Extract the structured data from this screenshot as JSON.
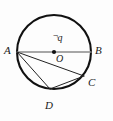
{
  "figure": {
    "type": "circle-geometry-diagram",
    "background_color": "#fdfdfd",
    "circle_stroke_color": "#111111",
    "diameter_stroke_color": "#8a8a8a",
    "chord_stroke_color": "#222222",
    "label_color": "#1a1a1a",
    "circle": {
      "center_x": 54,
      "center_y": 52,
      "radius": 37,
      "stroke_width": 2.1
    },
    "center_dot": {
      "name": "center-point-O",
      "x": 54,
      "y": 52,
      "radius": 2.1,
      "fill": "#111111"
    },
    "points": [
      {
        "id": "A",
        "label": "A",
        "x": 17,
        "y": 52,
        "label_x": 4,
        "label_y": 45
      },
      {
        "id": "B",
        "label": "B",
        "x": 91,
        "y": 52,
        "label_x": 95,
        "label_y": 45
      },
      {
        "id": "C",
        "label": "C",
        "x": 84,
        "y": 76,
        "label_x": 88,
        "label_y": 77
      },
      {
        "id": "D",
        "label": "D",
        "x": 50,
        "y": 89,
        "label_x": 45,
        "label_y": 100
      },
      {
        "id": "O",
        "label": "O",
        "x": 54,
        "y": 52,
        "label_x": 56,
        "label_y": 54
      }
    ],
    "segments": [
      {
        "name": "diameter-AB",
        "from": "A",
        "to": "B",
        "color": "#8a8a8a",
        "width": 1.7
      },
      {
        "name": "chord-AC",
        "from": "A",
        "to": "C",
        "color": "#222222",
        "width": 1.0
      },
      {
        "name": "chord-AD",
        "from": "A",
        "to": "D",
        "color": "#222222",
        "width": 1.0
      },
      {
        "name": "chord-DC",
        "from": "D",
        "to": "C",
        "color": "#222222",
        "width": 1.0
      }
    ],
    "charge_annotation": {
      "name": "charge-label-negative-q",
      "sign": "¬",
      "symbol": "q",
      "full_text": "¬q",
      "x": 53,
      "y": 31
    }
  }
}
